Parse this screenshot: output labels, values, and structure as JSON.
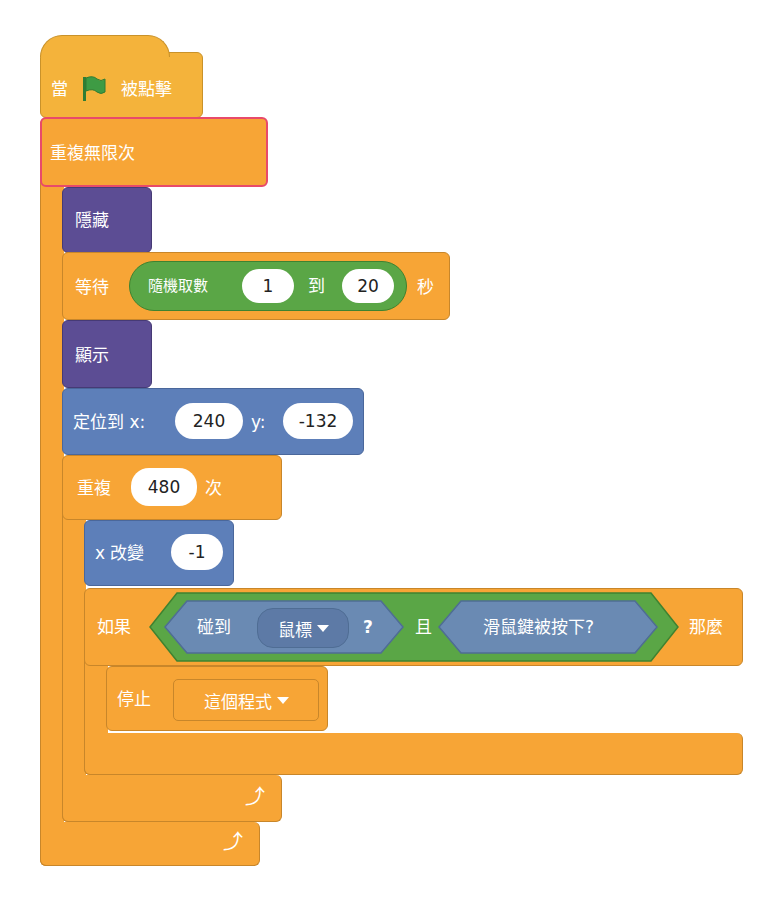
{
  "script": {
    "hat": {
      "prefix": "當",
      "icon": "green-flag-icon",
      "suffix": "被點擊"
    },
    "forever": {
      "label": "重複無限次",
      "highlighted": true,
      "highlight_color": "#e84a6a"
    },
    "hide": {
      "label": "隱藏"
    },
    "wait": {
      "label": "等待",
      "suffix": "秒",
      "random": {
        "label": "隨機取數",
        "from": "1",
        "to_label": "到",
        "to": "20"
      }
    },
    "show": {
      "label": "顯示"
    },
    "goto": {
      "label": "定位到 x:",
      "x": "240",
      "y_label": "y:",
      "y": "-132"
    },
    "repeat": {
      "label": "重複",
      "count": "480",
      "suffix": "次"
    },
    "change_x": {
      "label": "x 改變",
      "value": "-1"
    },
    "if": {
      "label": "如果",
      "then": "那麼",
      "cond_a": {
        "label": "碰到",
        "target": "鼠標",
        "q": "?"
      },
      "and_label": "且",
      "cond_b": {
        "label": "滑鼠鍵被按下?"
      }
    },
    "stop": {
      "label": "停止",
      "option": "這個程式"
    },
    "loop_arrow_icon": "loop-arrow-icon"
  },
  "colors": {
    "control": "#f7a536",
    "events": "#f4b33b",
    "looks": "#5c4d94",
    "motion": "#5d7fb9",
    "operators": "#5aa646",
    "sensing": "#6a8ab3",
    "flag": "#3e9b44"
  }
}
